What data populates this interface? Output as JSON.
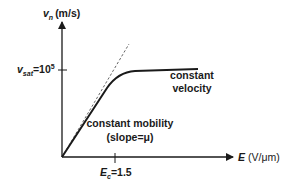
{
  "diagram": {
    "y_axis": {
      "symbol": "v",
      "subscript": "n",
      "unit": "(m/s)"
    },
    "x_axis": {
      "symbol": "E",
      "unit": "(V/μm)"
    },
    "y_tick": {
      "symbol": "v",
      "subscript": "sat",
      "value_prefix": "=10",
      "exponent": "5"
    },
    "x_tick": {
      "symbol": "E",
      "subscript": "c",
      "value": "=1.5"
    },
    "annotations": {
      "saturation_line1": "constant",
      "saturation_line2": "velocity",
      "linear_line1": "constant mobility",
      "linear_line2": "(slope=μ)"
    },
    "colors": {
      "ink": "#1a1a1a",
      "dashed": "#555555",
      "background": "#ffffff"
    }
  }
}
